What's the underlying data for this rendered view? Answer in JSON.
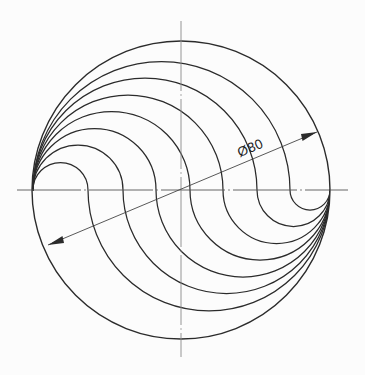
{
  "drawing": {
    "title": "Spiral rosette geometry - circular plan view",
    "background_color": "#fcfcfc",
    "line_color": "#2b2b2b",
    "centerline_color": "#555555",
    "dimension": {
      "label": "Ø80",
      "symbol": "diameter-symbol",
      "value": 80,
      "unit": "mm",
      "type": "diameter",
      "angle_deg": -22.8,
      "start": {
        "x": 48,
        "y": 245
      },
      "end": {
        "x": 317,
        "y": 132
      },
      "text_position": {
        "x": 252,
        "y": 152
      }
    },
    "geometry": {
      "center": {
        "x": 181,
        "y": 190
      },
      "outer_circle_radius": 149,
      "left_pole": {
        "x": 33,
        "y": 190
      },
      "right_pole": {
        "x": 330,
        "y": 190
      },
      "curve_count": 7,
      "curve_split_x": [
        88,
        123,
        156,
        190,
        223,
        257,
        290
      ],
      "symmetry": "180-degree rotational",
      "horizontal_centerline": {
        "x1": 17,
        "x2": 348,
        "y": 190
      },
      "vertical_centerline": {
        "x": 181,
        "y1": 21,
        "y2": 357
      }
    }
  }
}
